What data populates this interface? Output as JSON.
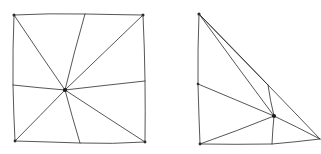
{
  "figure": {
    "title": "Hand-drawn fan triangulation diagrams",
    "background_color": "#ffffff",
    "stroke_color": "#2b2b2b",
    "stroke_width": 0.8,
    "canvas": {
      "width": 321,
      "height": 154
    },
    "panels": [
      {
        "name": "square-fan-triangulation",
        "shape": "square",
        "description": "Hand-drawn square with eight spokes radiating from an interior hub to the four corners and four edge points, forming eight triangles",
        "outline_points": [
          [
            14,
            15
          ],
          [
            85,
            14
          ],
          [
            143,
            15
          ],
          [
            145,
            81
          ],
          [
            145,
            142
          ],
          [
            80,
            143
          ],
          [
            15,
            141
          ],
          [
            13,
            85
          ]
        ],
        "corners": [
          {
            "label": "top-left",
            "x": 14,
            "y": 15
          },
          {
            "label": "top-right",
            "x": 143,
            "y": 15
          },
          {
            "label": "bottom-right",
            "x": 145,
            "y": 142
          },
          {
            "label": "bottom-left",
            "x": 15,
            "y": 141
          }
        ],
        "edge_points": [
          {
            "label": "top-edge-point",
            "x": 85,
            "y": 14
          },
          {
            "label": "right-edge-point",
            "x": 145,
            "y": 81
          },
          {
            "label": "bottom-edge-point",
            "x": 80,
            "y": 143
          },
          {
            "label": "left-edge-point",
            "x": 13,
            "y": 85
          }
        ],
        "hub": {
          "label": "center-hub",
          "x": 65,
          "y": 90
        },
        "spoke_count": 8,
        "triangle_count": 8
      },
      {
        "name": "triangle-fan-triangulation",
        "shape": "right-triangle",
        "description": "Hand-drawn right triangle with spokes radiating from an interior hub to the three vertices and boundary points, forming six triangles",
        "outline_points": [
          [
            199,
            14
          ],
          [
            268,
            85
          ],
          [
            320,
            139
          ],
          [
            272,
            144
          ],
          [
            200,
            144
          ],
          [
            198,
            84
          ]
        ],
        "corners": [
          {
            "label": "apex",
            "x": 199,
            "y": 14
          },
          {
            "label": "bottom-right",
            "x": 320,
            "y": 139
          },
          {
            "label": "bottom-left",
            "x": 200,
            "y": 144
          }
        ],
        "edge_points": [
          {
            "label": "left-edge-point",
            "x": 198,
            "y": 84
          },
          {
            "label": "hypotenuse-point",
            "x": 268,
            "y": 85
          },
          {
            "label": "bottom-edge-point",
            "x": 272,
            "y": 144
          }
        ],
        "hub": {
          "label": "interior-hub",
          "x": 274,
          "y": 116
        },
        "spoke_count": 6,
        "triangle_count": 6
      }
    ]
  }
}
